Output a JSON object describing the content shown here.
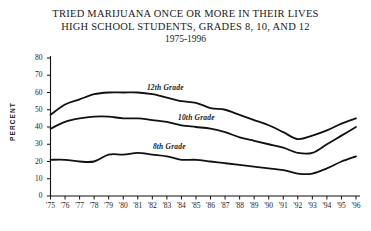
{
  "title": {
    "line1": "TRIED MARIJUANA ONCE OR MORE IN THEIR LIVES",
    "line2": "HIGH SCHOOL STUDENTS, GRADES 8, 10, AND 12",
    "line3": "1975-1996"
  },
  "axes": {
    "y_title": "PERCENT",
    "y_ticks": [
      "0",
      "10",
      "20",
      "30",
      "40",
      "50",
      "60",
      "70",
      "80"
    ],
    "x_ticks": [
      "'75",
      "'76",
      "'77",
      "'78",
      "'79",
      "'80",
      "'81",
      "'82",
      "'83",
      "'84",
      "'85",
      "'86",
      "'87",
      "'88",
      "'89",
      "'90",
      "'91",
      "'92",
      "'93",
      "'94",
      "'95",
      "'96"
    ]
  },
  "series_labels": {
    "grade12": "12th Grade",
    "grade10": "10th Grade",
    "grade8": "8th Grade"
  },
  "colors": {
    "line": "#111111",
    "axis": "#111111",
    "background": "#ffffff",
    "text": "#1a1a1a"
  },
  "chart_data": {
    "type": "line",
    "xlabel": "",
    "ylabel": "PERCENT",
    "xlim": [
      "'75",
      "'96"
    ],
    "ylim": [
      0,
      80
    ],
    "ytick_step": 10,
    "grid": false,
    "legend": "inline-series-labels",
    "x": [
      "'75",
      "'76",
      "'77",
      "'78",
      "'79",
      "'80",
      "'81",
      "'82",
      "'83",
      "'84",
      "'85",
      "'86",
      "'87",
      "'88",
      "'89",
      "'90",
      "'91",
      "'92",
      "'93",
      "'94",
      "'95",
      "'96"
    ],
    "series": [
      {
        "name": "12th Grade",
        "values": [
          47,
          53,
          56,
          59,
          60,
          60,
          60,
          59,
          57,
          55,
          54,
          51,
          50,
          47,
          44,
          41,
          37,
          33,
          35,
          38,
          42,
          45
        ]
      },
      {
        "name": "10th Grade",
        "values": [
          39,
          43,
          45,
          46,
          46,
          45,
          45,
          44,
          43,
          41,
          40,
          39,
          37,
          34,
          32,
          30,
          28,
          25,
          25,
          30,
          35,
          40
        ]
      },
      {
        "name": "8th Grade",
        "values": [
          21,
          21,
          20,
          20,
          24,
          24,
          25,
          24,
          23,
          21,
          21,
          20,
          19,
          18,
          17,
          16,
          15,
          13,
          13,
          16,
          20,
          23
        ]
      }
    ]
  }
}
